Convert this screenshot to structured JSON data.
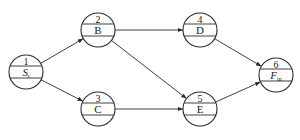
{
  "diagram": {
    "type": "activity-network",
    "nodes": [
      {
        "id": "1",
        "number": "1",
        "label": "S",
        "subscript": "t",
        "italic": true,
        "cx": 26,
        "cy": 72
      },
      {
        "id": "2",
        "number": "2",
        "label": "B",
        "subscript": "",
        "italic": false,
        "cx": 98,
        "cy": 30
      },
      {
        "id": "3",
        "number": "3",
        "label": "C",
        "subscript": "",
        "italic": false,
        "cx": 98,
        "cy": 109
      },
      {
        "id": "4",
        "number": "4",
        "label": "D",
        "subscript": "",
        "italic": false,
        "cx": 200,
        "cy": 30
      },
      {
        "id": "5",
        "number": "5",
        "label": "E",
        "subscript": "",
        "italic": false,
        "cx": 200,
        "cy": 109
      },
      {
        "id": "6",
        "number": "6",
        "label": "F",
        "subscript": "in",
        "italic": true,
        "cx": 276,
        "cy": 75
      }
    ],
    "edges": [
      {
        "from": "1",
        "to": "2"
      },
      {
        "from": "1",
        "to": "3"
      },
      {
        "from": "2",
        "to": "4"
      },
      {
        "from": "2",
        "to": "5"
      },
      {
        "from": "3",
        "to": "5"
      },
      {
        "from": "4",
        "to": "6"
      },
      {
        "from": "5",
        "to": "6"
      }
    ],
    "style": {
      "stroke": "#2a2a2a",
      "background": "#ffffff",
      "node_radius": 17
    }
  }
}
